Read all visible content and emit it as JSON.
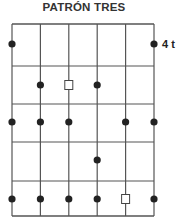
{
  "title": "PATRÓN TRES",
  "side_label": "4 t",
  "diagram": {
    "strings": 6,
    "frets": 5,
    "grid": {
      "left": 12,
      "right": 154,
      "top": 24,
      "fret_lines_y": [
        24,
        66,
        104,
        142,
        181,
        216
      ]
    },
    "line_color": "#555555",
    "dot_color": "#222222",
    "rows": [
      {
        "y": 44,
        "markers": [
          "dot",
          null,
          null,
          null,
          null,
          "dot"
        ]
      },
      {
        "y": 85,
        "markers": [
          null,
          "dot",
          "square",
          "dot",
          null,
          null
        ]
      },
      {
        "y": 122,
        "markers": [
          "dot",
          "dot",
          "dot",
          null,
          "dot",
          "dot"
        ]
      },
      {
        "y": 160,
        "markers": [
          null,
          null,
          null,
          "dot",
          null,
          null
        ]
      },
      {
        "y": 199,
        "markers": [
          "dot",
          "dot",
          "dot",
          "dot",
          "square",
          "dot"
        ]
      }
    ]
  }
}
